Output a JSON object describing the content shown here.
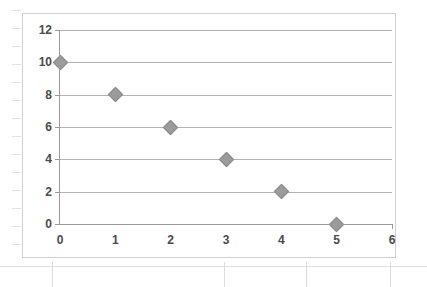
{
  "chart_data": {
    "type": "scatter",
    "title": "",
    "subtitle": "",
    "xlabel": "",
    "ylabel": "",
    "xlim": [
      0,
      6
    ],
    "ylim": [
      0,
      12
    ],
    "x_ticks": [
      0,
      1,
      2,
      3,
      4,
      5,
      6
    ],
    "y_ticks": [
      0,
      2,
      4,
      6,
      8,
      10,
      12
    ],
    "x_tick_labels": [
      "0",
      "1",
      "2",
      "3",
      "4",
      "5",
      "6"
    ],
    "y_tick_labels": [
      "0",
      "2",
      "4",
      "6",
      "8",
      "10",
      "12"
    ],
    "grid": "horizontal",
    "legend": null,
    "legend_position": "none",
    "marker": "diamond",
    "marker_color": "#9b9b9b",
    "gridline_color": "#b2b2b2",
    "axis_color": "#9a9a9a",
    "label_color": "#4a4a4a",
    "background_color": "#ffffff",
    "frame_color": "#cfcfcf",
    "series": [
      {
        "name": "Series 1",
        "x": [
          0,
          1,
          2,
          3,
          4,
          5
        ],
        "y": [
          10,
          8,
          6,
          4,
          2,
          0
        ],
        "points": [
          {
            "x": 0,
            "y": 10
          },
          {
            "x": 1,
            "y": 8
          },
          {
            "x": 2,
            "y": 6
          },
          {
            "x": 3,
            "y": 4
          },
          {
            "x": 4,
            "y": 2
          },
          {
            "x": 5,
            "y": 0
          }
        ]
      }
    ]
  }
}
